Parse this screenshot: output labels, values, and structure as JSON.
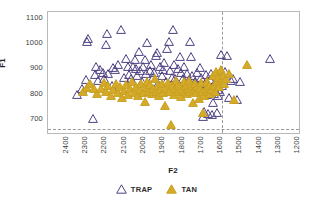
{
  "chart_data": {
    "type": "scatter",
    "title": "",
    "xlabel": "F2",
    "ylabel": "F1",
    "xlim": [
      2450,
      1150
    ],
    "ylim": [
      1120,
      640
    ],
    "x_inverted": true,
    "y_inverted": true,
    "grid": false,
    "xticks": [
      2400,
      2300,
      2200,
      2100,
      2000,
      1900,
      1800,
      1700,
      1600,
      1500,
      1400,
      1300,
      1200
    ],
    "yticks": [
      700,
      800,
      900,
      1000,
      1100
    ],
    "legend_position": "bottom-center",
    "annotations": [
      {
        "name": "horizontal-reference-line",
        "type": "hline",
        "y": 655,
        "style": "dashed",
        "color": "#9a9a9a"
      },
      {
        "name": "vertical-reference-line",
        "type": "vline",
        "x": 1550,
        "style": "dashed",
        "color": "#9a9a9a"
      }
    ],
    "series": [
      {
        "name": "TRAP",
        "marker": "triangle-open",
        "color": "#ffffff",
        "edgecolor": "#4f4183",
        "points": [
          [
            2300,
            793
          ],
          [
            2272,
            816
          ],
          [
            2254,
            853
          ],
          [
            2248,
            1003
          ],
          [
            2243,
            1015
          ],
          [
            2215,
            698
          ],
          [
            2208,
            873
          ],
          [
            2200,
            905
          ],
          [
            2190,
            848
          ],
          [
            2182,
            893
          ],
          [
            2165,
            880
          ],
          [
            2160,
            857
          ],
          [
            2150,
            993
          ],
          [
            2143,
            1035
          ],
          [
            2138,
            875
          ],
          [
            2120,
            828
          ],
          [
            2112,
            900
          ],
          [
            2105,
            891
          ],
          [
            2090,
            913
          ],
          [
            2070,
            1050
          ],
          [
            2055,
            862
          ],
          [
            2045,
            934
          ],
          [
            2038,
            905
          ],
          [
            2030,
            873
          ],
          [
            2022,
            855
          ],
          [
            2008,
            903
          ],
          [
            2000,
            931
          ],
          [
            1995,
            896
          ],
          [
            1988,
            867
          ],
          [
            1980,
            962
          ],
          [
            1972,
            886
          ],
          [
            1965,
            846
          ],
          [
            1958,
            905
          ],
          [
            1950,
            932
          ],
          [
            1944,
            875
          ],
          [
            1938,
            999
          ],
          [
            1930,
            820
          ],
          [
            1922,
            889
          ],
          [
            1915,
            913
          ],
          [
            1908,
            862
          ],
          [
            1900,
            880
          ],
          [
            1893,
            947
          ],
          [
            1885,
            958
          ],
          [
            1878,
            838
          ],
          [
            1870,
            905
          ],
          [
            1862,
            870
          ],
          [
            1855,
            893
          ],
          [
            1848,
            921
          ],
          [
            1840,
            846
          ],
          [
            1833,
            975
          ],
          [
            1825,
            1002
          ],
          [
            1818,
            886
          ],
          [
            1810,
            862
          ],
          [
            1805,
            1049
          ],
          [
            1798,
            913
          ],
          [
            1790,
            858
          ],
          [
            1782,
            835
          ],
          [
            1775,
            896
          ],
          [
            1768,
            943
          ],
          [
            1760,
            880
          ],
          [
            1752,
            857
          ],
          [
            1745,
            905
          ],
          [
            1738,
            826
          ],
          [
            1730,
            876
          ],
          [
            1722,
            851
          ],
          [
            1715,
            1001
          ],
          [
            1710,
            942
          ],
          [
            1702,
            869
          ],
          [
            1695,
            814
          ],
          [
            1688,
            845
          ],
          [
            1680,
            880
          ],
          [
            1672,
            828
          ],
          [
            1665,
            900
          ],
          [
            1658,
            861
          ],
          [
            1650,
            812
          ],
          [
            1645,
            706
          ],
          [
            1640,
            726
          ],
          [
            1635,
            838
          ],
          [
            1630,
            872
          ],
          [
            1625,
            793
          ],
          [
            1620,
            718
          ],
          [
            1615,
            806
          ],
          [
            1610,
            851
          ],
          [
            1605,
            878
          ],
          [
            1600,
            715
          ],
          [
            1596,
            760
          ],
          [
            1592,
            822
          ],
          [
            1588,
            795
          ],
          [
            1584,
            842
          ],
          [
            1580,
            869
          ],
          [
            1576,
            722
          ],
          [
            1572,
            788
          ],
          [
            1568,
            814
          ],
          [
            1564,
            856
          ],
          [
            1560,
            805
          ],
          [
            1555,
            950
          ],
          [
            1550,
            830
          ],
          [
            1545,
            865
          ],
          [
            1535,
            884
          ],
          [
            1525,
            948
          ],
          [
            1510,
            782
          ],
          [
            1500,
            847
          ],
          [
            1490,
            857
          ],
          [
            1470,
            771
          ],
          [
            1455,
            846
          ],
          [
            1300,
            935
          ]
        ]
      },
      {
        "name": "TAN",
        "marker": "triangle-filled",
        "color": "#d5aa28",
        "edgecolor": "#c8a022",
        "points": [
          [
            2270,
            805
          ],
          [
            2250,
            820
          ],
          [
            2230,
            838
          ],
          [
            2210,
            818
          ],
          [
            2195,
            797
          ],
          [
            2175,
            815
          ],
          [
            2162,
            840
          ],
          [
            2150,
            805
          ],
          [
            2138,
            830
          ],
          [
            2125,
            790
          ],
          [
            2112,
            812
          ],
          [
            2100,
            838
          ],
          [
            2090,
            802
          ],
          [
            2078,
            826
          ],
          [
            2066,
            780
          ],
          [
            2055,
            808
          ],
          [
            2045,
            832
          ],
          [
            2035,
            793
          ],
          [
            2025,
            818
          ],
          [
            2015,
            845
          ],
          [
            2005,
            800
          ],
          [
            1995,
            826
          ],
          [
            1985,
            790
          ],
          [
            1975,
            812
          ],
          [
            1968,
            838
          ],
          [
            1958,
            802
          ],
          [
            1950,
            765
          ],
          [
            1942,
            820
          ],
          [
            1935,
            845
          ],
          [
            1928,
            806
          ],
          [
            1920,
            832
          ],
          [
            1912,
            795
          ],
          [
            1905,
            818
          ],
          [
            1898,
            855
          ],
          [
            1890,
            806
          ],
          [
            1882,
            828
          ],
          [
            1875,
            788
          ],
          [
            1868,
            812
          ],
          [
            1860,
            838
          ],
          [
            1852,
            802
          ],
          [
            1845,
            750
          ],
          [
            1838,
            818
          ],
          [
            1830,
            842
          ],
          [
            1822,
            806
          ],
          [
            1815,
            675
          ],
          [
            1808,
            828
          ],
          [
            1800,
            793
          ],
          [
            1792,
            815
          ],
          [
            1785,
            848
          ],
          [
            1778,
            805
          ],
          [
            1770,
            830
          ],
          [
            1762,
            786
          ],
          [
            1755,
            812
          ],
          [
            1748,
            845
          ],
          [
            1742,
            806
          ],
          [
            1736,
            828
          ],
          [
            1730,
            795
          ],
          [
            1724,
            818
          ],
          [
            1718,
            850
          ],
          [
            1712,
            806
          ],
          [
            1706,
            830
          ],
          [
            1700,
            762
          ],
          [
            1694,
            812
          ],
          [
            1688,
            838
          ],
          [
            1682,
            800
          ],
          [
            1676,
            826
          ],
          [
            1670,
            775
          ],
          [
            1664,
            815
          ],
          [
            1658,
            842
          ],
          [
            1652,
            806
          ],
          [
            1646,
            720
          ],
          [
            1640,
            790
          ],
          [
            1634,
            818
          ],
          [
            1628,
            845
          ],
          [
            1622,
            806
          ],
          [
            1616,
            828
          ],
          [
            1610,
            795
          ],
          [
            1604,
            812
          ],
          [
            1598,
            868
          ],
          [
            1592,
            830
          ],
          [
            1586,
            806
          ],
          [
            1580,
            882
          ],
          [
            1574,
            845
          ],
          [
            1568,
            862
          ],
          [
            1562,
            826
          ],
          [
            1556,
            892
          ],
          [
            1550,
            848
          ],
          [
            1544,
            868
          ],
          [
            1536,
            836
          ],
          [
            1528,
            858
          ],
          [
            1515,
            878
          ],
          [
            1488,
            773
          ],
          [
            1420,
            910
          ]
        ]
      }
    ]
  },
  "axes": {
    "x_title": "F2",
    "y_title": "F1",
    "x_tick_labels": [
      "2400",
      "2300",
      "2200",
      "2100",
      "2000",
      "1900",
      "1800",
      "1700",
      "1600",
      "1500",
      "1400",
      "1300",
      "1200"
    ],
    "y_tick_labels": [
      "700",
      "800",
      "900",
      "1000",
      "1100"
    ]
  },
  "legend": {
    "items": [
      {
        "label": "TRAP",
        "marker": "triangle-open-icon",
        "fill": "#ffffff",
        "stroke": "#4f4183"
      },
      {
        "label": "TAN",
        "marker": "triangle-filled-icon",
        "fill": "#d5aa28",
        "stroke": "#c8a022"
      }
    ]
  },
  "colors": {
    "trap_edge": "#4f4183",
    "tan_fill": "#d5aa28",
    "frame": "#b9b9b9",
    "reference_line": "#9a9a9a",
    "text": "#3b3b3b",
    "background": "#ffffff"
  }
}
